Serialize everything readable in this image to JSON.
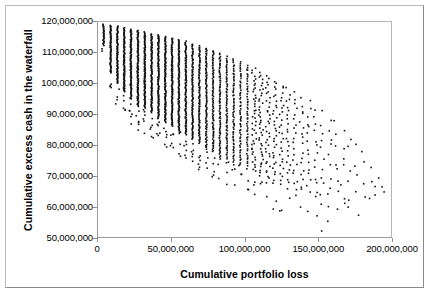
{
  "chart_data": {
    "type": "scatter",
    "title": "",
    "xlabel": "Cumulative portfolio loss",
    "ylabel": "Cumulative excess cash in the waterfall",
    "xlim": [
      0,
      200000000
    ],
    "ylim": [
      50000000,
      120000000
    ],
    "grid": false,
    "legend": null,
    "marker": {
      "shape": "square",
      "color": "#111111",
      "size_px": 1.6
    },
    "x_ticks": [
      0,
      50000000,
      100000000,
      150000000,
      200000000
    ],
    "x_tick_labels": [
      "0",
      "50,000,000",
      "100,000,000",
      "150,000,000",
      "200,000,000"
    ],
    "y_ticks": [
      50000000,
      60000000,
      70000000,
      80000000,
      90000000,
      100000000,
      110000000,
      120000000
    ],
    "y_tick_labels": [
      "50,000,000",
      "60,000,000",
      "70,000,000",
      "80,000,000",
      "90,000,000",
      "100,000,000",
      "110,000,000",
      "120,000,000"
    ],
    "columns": [
      {
        "x": 3200000,
        "y_top": 119600000,
        "y_bottom": 112600000,
        "n": 26,
        "density": 1.0
      },
      {
        "x": 8000000,
        "y_top": 119300000,
        "y_bottom": 103800000,
        "n": 60,
        "density": 1.0
      },
      {
        "x": 12600000,
        "y_top": 119000000,
        "y_bottom": 100300000,
        "n": 74,
        "density": 1.0
      },
      {
        "x": 17200000,
        "y_top": 118500000,
        "y_bottom": 97600000,
        "n": 84,
        "density": 1.0
      },
      {
        "x": 21800000,
        "y_top": 118100000,
        "y_bottom": 95300000,
        "n": 92,
        "density": 1.0
      },
      {
        "x": 26500000,
        "y_top": 117600000,
        "y_bottom": 93000000,
        "n": 98,
        "density": 1.0
      },
      {
        "x": 31200000,
        "y_top": 117100000,
        "y_bottom": 92400000,
        "n": 98,
        "density": 1.0
      },
      {
        "x": 35800000,
        "y_top": 116500000,
        "y_bottom": 91000000,
        "n": 100,
        "density": 1.0
      },
      {
        "x": 40400000,
        "y_top": 116200000,
        "y_bottom": 89000000,
        "n": 104,
        "density": 1.0
      },
      {
        "x": 45100000,
        "y_top": 115700000,
        "y_bottom": 87800000,
        "n": 106,
        "density": 1.0
      },
      {
        "x": 49700000,
        "y_top": 115200000,
        "y_bottom": 86600000,
        "n": 106,
        "density": 1.0
      },
      {
        "x": 54300000,
        "y_top": 114700000,
        "y_bottom": 85000000,
        "n": 104,
        "density": 0.98
      },
      {
        "x": 59000000,
        "y_top": 114100000,
        "y_bottom": 83800000,
        "n": 100,
        "density": 0.96
      },
      {
        "x": 63600000,
        "y_top": 113300000,
        "y_bottom": 82200000,
        "n": 96,
        "density": 0.94
      },
      {
        "x": 68200000,
        "y_top": 112700000,
        "y_bottom": 81000000,
        "n": 92,
        "density": 0.92
      },
      {
        "x": 72900000,
        "y_top": 112000000,
        "y_bottom": 79600000,
        "n": 86,
        "density": 0.9
      },
      {
        "x": 77500000,
        "y_top": 111200000,
        "y_bottom": 78200000,
        "n": 80,
        "density": 0.86
      },
      {
        "x": 82100000,
        "y_top": 110400000,
        "y_bottom": 77000000,
        "n": 74,
        "density": 0.82
      },
      {
        "x": 86800000,
        "y_top": 109300000,
        "y_bottom": 76000000,
        "n": 68,
        "density": 0.78
      },
      {
        "x": 91400000,
        "y_top": 108400000,
        "y_bottom": 75000000,
        "n": 62,
        "density": 0.74
      },
      {
        "x": 96000000,
        "y_top": 107600000,
        "y_bottom": 74000000,
        "n": 56,
        "density": 0.7
      },
      {
        "x": 100700000,
        "y_top": 106800000,
        "y_bottom": 72800000,
        "n": 50,
        "density": 0.64
      },
      {
        "x": 105300000,
        "y_top": 105600000,
        "y_bottom": 71600000,
        "n": 44,
        "density": 0.6
      },
      {
        "x": 109900000,
        "y_top": 104400000,
        "y_bottom": 70400000,
        "n": 40,
        "density": 0.55
      },
      {
        "x": 114600000,
        "y_top": 103200000,
        "y_bottom": 69200000,
        "n": 35,
        "density": 0.5
      },
      {
        "x": 119200000,
        "y_top": 102000000,
        "y_bottom": 68000000,
        "n": 31,
        "density": 0.45
      },
      {
        "x": 123800000,
        "y_top": 100600000,
        "y_bottom": 67000000,
        "n": 27,
        "density": 0.4
      },
      {
        "x": 128500000,
        "y_top": 99400000,
        "y_bottom": 66200000,
        "n": 23,
        "density": 0.36
      },
      {
        "x": 133100000,
        "y_top": 98000000,
        "y_bottom": 65400000,
        "n": 20,
        "density": 0.32
      },
      {
        "x": 137700000,
        "y_top": 96600000,
        "y_bottom": 64600000,
        "n": 17,
        "density": 0.28
      },
      {
        "x": 142400000,
        "y_top": 95200000,
        "y_bottom": 63800000,
        "n": 15,
        "density": 0.25
      },
      {
        "x": 147000000,
        "y_top": 93600000,
        "y_bottom": 62000000,
        "n": 13,
        "density": 0.22
      },
      {
        "x": 151600000,
        "y_top": 92000000,
        "y_bottom": 60500000,
        "n": 11,
        "density": 0.19
      },
      {
        "x": 156300000,
        "y_top": 90400000,
        "y_bottom": 59500000,
        "n": 10,
        "density": 0.17
      },
      {
        "x": 160900000,
        "y_top": 88800000,
        "y_bottom": 58600000,
        "n": 8,
        "density": 0.15
      },
      {
        "x": 165500000,
        "y_top": 87200000,
        "y_bottom": 57800000,
        "n": 7,
        "density": 0.13
      },
      {
        "x": 170200000,
        "y_top": 85600000,
        "y_bottom": 57000000,
        "n": 6,
        "density": 0.11
      },
      {
        "x": 174800000,
        "y_top": 84000000,
        "y_bottom": 56200000,
        "n": 5,
        "density": 0.1
      },
      {
        "x": 179400000,
        "y_top": 82000000,
        "y_bottom": 62000000,
        "n": 4,
        "density": 0.09
      },
      {
        "x": 184100000,
        "y_top": 78000000,
        "y_bottom": 63000000,
        "n": 3,
        "density": 0.08
      },
      {
        "x": 188700000,
        "y_top": 72000000,
        "y_bottom": 64000000,
        "n": 3,
        "density": 0.07
      },
      {
        "x": 193300000,
        "y_top": 68000000,
        "y_bottom": 63500000,
        "n": 2,
        "density": 0.06
      }
    ]
  }
}
